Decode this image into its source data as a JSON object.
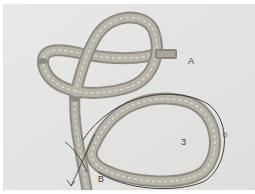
{
  "image": {
    "subject": "rope knot photograph with annotations",
    "background_color": "#e4e4e2",
    "rope_color": "#a8a49a",
    "rope_highlight": "#d6d3c8",
    "annotation_color": "#333333"
  },
  "annotations": {
    "label_a": "A",
    "label_b": "B",
    "label_3": "3"
  }
}
